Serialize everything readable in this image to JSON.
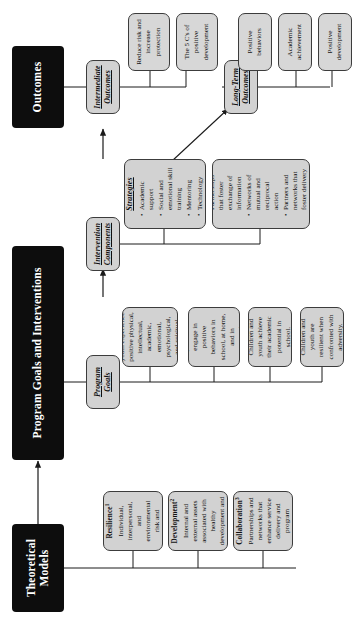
{
  "diagram": {
    "colors": {
      "header_bg": "#0d0d0d",
      "header_text": "#ffffff",
      "box_bg": "#d2d2d2",
      "box_border": "#3c3c3c",
      "line": "#1a1a1a",
      "page_bg": "#ffffff"
    }
  },
  "headers": {
    "theoretical_models": "Theoretical Models",
    "program_goals_and_interventions": "Program Goals and Interventions",
    "outcomes": "Outcomes"
  },
  "theoretical_models": [
    {
      "title": "Risk and Resilience",
      "superscript": "1",
      "body": "Individual, interpersonal, and environmental risk and protective factors"
    },
    {
      "title": "Positive Youth Development",
      "superscript": "2",
      "body": "Internal and external assets associated with healthy development and adaptation"
    },
    {
      "title": "Community Collaboration",
      "superscript": "3",
      "body": "Partnerships and networks that enhance service delivery and program effectiveness"
    }
  ],
  "program_goals": {
    "header": "Program Goals",
    "items": [
      "Children and youth experience positive physical, intellectual, academic, emotional, psychological, and spiritual development.",
      "Children and youth will engage in positive behaviors in school, at home, and in community settings.",
      "Children and youth achieve their academic potential in school.",
      "Children and youth are resilient when confronted with adversity."
    ]
  },
  "intervention_components": {
    "header": "Intervention Components",
    "groups": [
      {
        "title": "Child and Youth Strategies",
        "bullets": [
          "Academic support",
          "Social and emotional skill training",
          "Mentoring",
          "Technology training"
        ]
      },
      {
        "title": "Community Strategies",
        "bullets": [
          "Partnerships that foster exchange of information",
          "Networks of mutual and reciprocal action",
          "Partners and networks that foster delivery of jointly produced services"
        ]
      }
    ]
  },
  "outcomes": {
    "intermediate": {
      "header": "Intermediate Outcomes",
      "items": [
        "Reduce risk and increase protection",
        "The 5 C's of positive development"
      ]
    },
    "long_term": {
      "header": "Long-Term Outcomes",
      "items": [
        "Positive behaviors",
        "Academic achievement",
        "Positive development"
      ]
    }
  }
}
